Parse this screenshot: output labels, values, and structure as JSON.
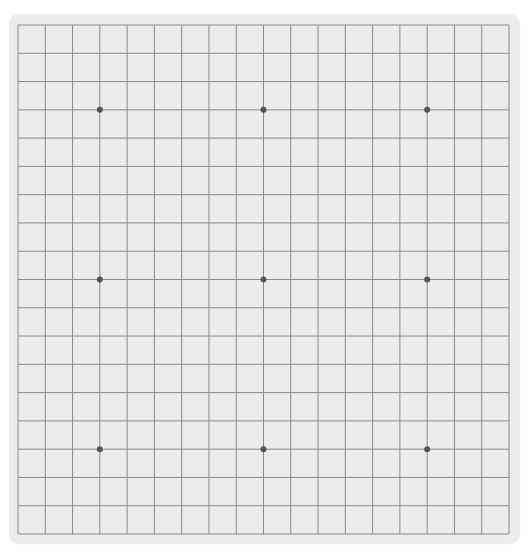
{
  "game": "go",
  "board": {
    "size": 19,
    "background_color": "#ececec",
    "line_color": "#8a8a8a",
    "star_color": "#555555",
    "star_points": [
      [
        3,
        3
      ],
      [
        9,
        3
      ],
      [
        15,
        3
      ],
      [
        3,
        9
      ],
      [
        9,
        9
      ],
      [
        15,
        9
      ],
      [
        3,
        15
      ],
      [
        9,
        15
      ],
      [
        15,
        15
      ]
    ],
    "stones": []
  }
}
